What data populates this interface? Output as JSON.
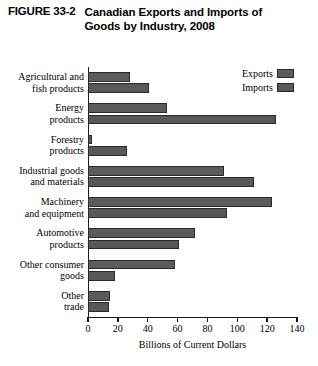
{
  "figure": {
    "number": "FIGURE 33-2",
    "title": "Canadian Exports and Imports of Goods by Industry, 2008"
  },
  "legend": {
    "position": "top-right",
    "items": [
      {
        "label": "Exports",
        "color": "#5b5b5b"
      },
      {
        "label": "Imports",
        "color": "#585858"
      }
    ]
  },
  "chart_data": {
    "type": "bar",
    "orientation": "horizontal",
    "title": "Canadian Exports and Imports of Goods by Industry, 2008",
    "xlabel": "Billions of Current Dollars",
    "ylabel": "",
    "xlim": [
      0,
      140
    ],
    "xticks": [
      0,
      20,
      40,
      60,
      80,
      100,
      120,
      140
    ],
    "grid": false,
    "legend_position": "top-right",
    "categories": [
      "Agricultural and fish products",
      "Energy products",
      "Forestry products",
      "Industrial goods and materials",
      "Machinery and equipment",
      "Automotive products",
      "Other consumer goods",
      "Other trade"
    ],
    "category_lines": [
      [
        "Agricultural and",
        "fish products"
      ],
      [
        "Energy",
        "products"
      ],
      [
        "Forestry",
        "products"
      ],
      [
        "Industrial goods",
        "and materials"
      ],
      [
        "Machinery",
        "and equipment"
      ],
      [
        "Automotive",
        "products"
      ],
      [
        "Other consumer",
        "goods"
      ],
      [
        "Other",
        "trade"
      ]
    ],
    "series": [
      {
        "name": "Exports",
        "color": "#5b5b5b",
        "values": [
          28,
          53,
          3,
          91,
          123,
          72,
          58,
          15
        ]
      },
      {
        "name": "Imports",
        "color": "#585858",
        "values": [
          41,
          126,
          26,
          111,
          93,
          61,
          18,
          14
        ]
      }
    ]
  }
}
